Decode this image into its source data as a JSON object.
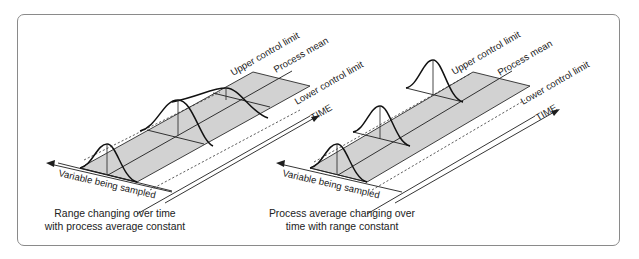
{
  "figure": {
    "panels": [
      {
        "id": "left",
        "labels": {
          "upper_control_limit": "Upper control limit",
          "process_mean": "Process mean",
          "lower_control_limit": "Lower control limit",
          "time_axis": "TIME",
          "variable_axis": "Variable being sampled"
        },
        "caption_line1": "Range changing over time",
        "caption_line2": "with process average constant"
      },
      {
        "id": "right",
        "labels": {
          "upper_control_limit": "Upper control limit",
          "process_mean": "Process mean",
          "lower_control_limit": "Lower control limit",
          "time_axis": "TIME",
          "variable_axis": "Variable being sampled"
        },
        "caption_line1": "Process average changing over",
        "caption_line2": "time with range constant"
      }
    ],
    "colors": {
      "band_fill": "#d2d2d2",
      "frame_border": "#8a8a8a",
      "line": "#1e1e1e"
    }
  }
}
